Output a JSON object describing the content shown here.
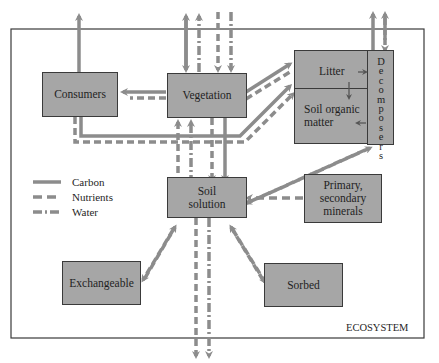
{
  "diagram": {
    "boundary_label": "ECOSYSTEM",
    "boxes": {
      "consumers": "Consumers",
      "vegetation": "Vegetation",
      "litter": "Litter",
      "soil_organic_matter_1": "Soil organic",
      "soil_organic_matter_2": "matter",
      "decomposers": "Decomposers",
      "soil_solution_1": "Soil",
      "soil_solution_2": "solution",
      "primary_minerals_1": "Primary,",
      "primary_minerals_2": "secondary",
      "primary_minerals_3": "minerals",
      "exchangeable": "Exchangeable",
      "sorbed": "Sorbed"
    },
    "legend": {
      "items": [
        {
          "label": "Carbon",
          "style": "solid"
        },
        {
          "label": "Nutrients",
          "style": "dashed"
        },
        {
          "label": "Water",
          "style": "dash-dot"
        }
      ]
    },
    "colors": {
      "box_fill": "#a6a6a6",
      "arrow": "#8c8c8c",
      "border": "#3a3a3a"
    }
  }
}
